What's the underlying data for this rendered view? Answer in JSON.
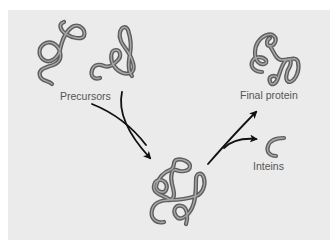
{
  "diagram": {
    "background_color": "#ebebeb",
    "strand_color": "#5e5e5e",
    "arrow_color": "#111111",
    "nodes": [
      {
        "id": "precursors",
        "label": "Precursors",
        "count": 2
      },
      {
        "id": "intermediate",
        "label": ""
      },
      {
        "id": "final-protein",
        "label": "Final protein"
      },
      {
        "id": "inteins",
        "label": "Inteins"
      }
    ],
    "edges": [
      {
        "from": "precursors",
        "to": "intermediate"
      },
      {
        "from": "intermediate",
        "to": "final-protein"
      },
      {
        "from": "intermediate",
        "to": "inteins"
      }
    ]
  },
  "labels": {
    "precursors": "Precursors",
    "final_protein": "Final protein",
    "inteins": "Inteins"
  }
}
